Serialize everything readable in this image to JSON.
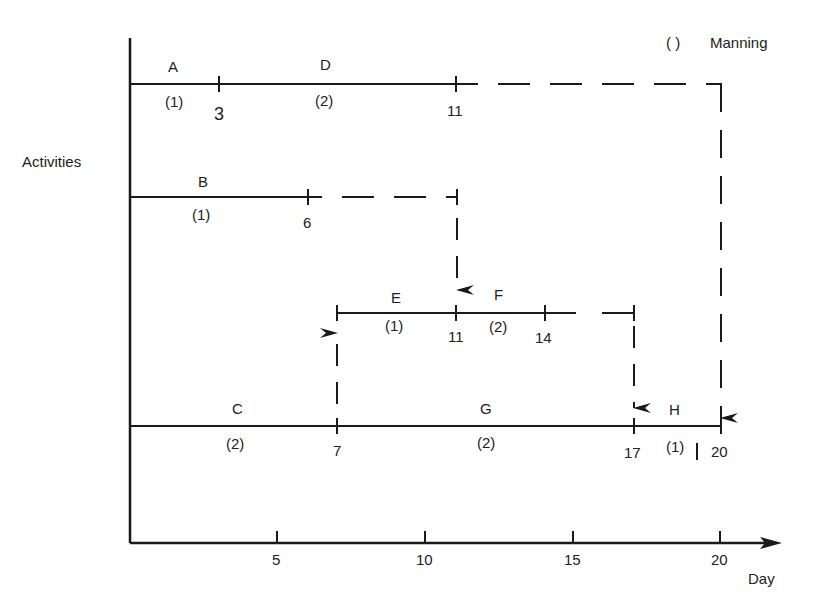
{
  "diagram": {
    "type": "time-scaled activity network (bar chart with manning)",
    "legend": {
      "symbol": "( )",
      "label": "Manning"
    },
    "y_axis_label": "Activities",
    "x_axis_label": "Day",
    "x_ticks": [
      "5",
      "10",
      "15",
      "20"
    ],
    "activities": [
      {
        "name": "A",
        "start": 0,
        "end": 3,
        "manning": "(1)"
      },
      {
        "name": "D",
        "start": 3,
        "end": 11,
        "manning": "(2)"
      },
      {
        "name": "B",
        "start": 0,
        "end": 6,
        "manning": "(1)"
      },
      {
        "name": "E",
        "start": 7,
        "end": 11,
        "manning": "(1)"
      },
      {
        "name": "F",
        "start": 11,
        "end": 14,
        "manning": "(2)"
      },
      {
        "name": "C",
        "start": 0,
        "end": 7,
        "manning": "(2)"
      },
      {
        "name": "G",
        "start": 7,
        "end": 17,
        "manning": "(2)"
      },
      {
        "name": "H",
        "start": 17,
        "end": 20,
        "manning": "(1)"
      }
    ],
    "event_labels": {
      "a_end": "3",
      "d_end": "11",
      "b_end": "6",
      "e_end": "11",
      "f_end": "14",
      "c_end": "7",
      "g_end": "17",
      "h_end": "20"
    }
  }
}
